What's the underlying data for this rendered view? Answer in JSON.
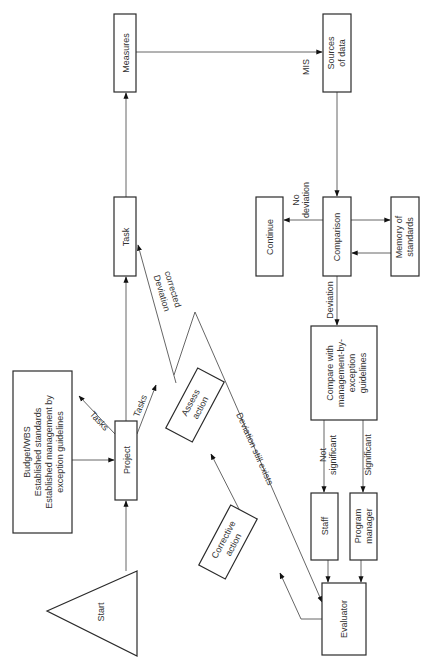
{
  "nodes": {
    "measures": "Measures",
    "sources_1": "Sources",
    "sources_2": "of data",
    "task": "Task",
    "continue": "Continue",
    "comparison": "Comparison",
    "memory_1": "Memory of",
    "memory_2": "standards",
    "compare_1": "Compare with",
    "compare_2": "management-by-",
    "compare_3": "exception",
    "compare_4": "guidelines",
    "staff": "Staff",
    "pm_1": "Program",
    "pm_2": "manager",
    "evaluator": "Evaluator",
    "project": "Project",
    "budget_1": "Budget/WBS",
    "budget_2": "Established standards",
    "budget_3": "Established management by",
    "budget_4": "exception guidelines",
    "start": "Start",
    "corrective_1": "Corrective",
    "corrective_2": "action",
    "assess_1": "Assess",
    "assess_2": "action"
  },
  "edges": {
    "mis": "MIS",
    "no_dev_1": "No",
    "no_dev_2": "deviation",
    "deviation": "Deviation",
    "not_sig_1": "Not",
    "not_sig_2": "significant",
    "significant": "Significant",
    "dev_corrected_1": "Deviation",
    "dev_corrected_2": "corrected",
    "dev_still": "Deviation still exists",
    "tasks_left": "Tasks",
    "tasks_right": "Tasks"
  }
}
